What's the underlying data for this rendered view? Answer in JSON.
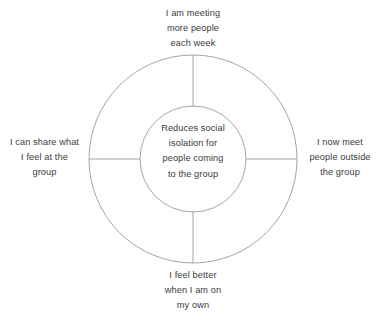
{
  "diagram": {
    "type": "concentric-circle-spoke",
    "center": {
      "lines": [
        "Reduces social",
        "isolation for",
        "people coming",
        "to the group"
      ]
    },
    "spokes": [
      {
        "position": "top",
        "lines": [
          "I am meeting",
          "more people",
          "each week"
        ]
      },
      {
        "position": "right",
        "lines": [
          "I now meet",
          "people outside",
          "the group"
        ]
      },
      {
        "position": "bottom",
        "lines": [
          "I feel better",
          "when I am on",
          "my own"
        ]
      },
      {
        "position": "left",
        "lines": [
          "I can share what",
          "I feel at the",
          "group"
        ]
      }
    ],
    "geometry": {
      "center_x": 193,
      "center_y": 159,
      "outer_radius": 104,
      "inner_radius": 53
    },
    "colors": {
      "stroke": "#a6a6a6",
      "text": "#3a3a3a",
      "background": "#ffffff"
    }
  }
}
